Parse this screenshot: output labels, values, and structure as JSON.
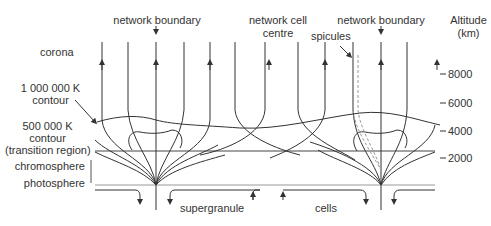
{
  "title_cut": "",
  "labels": {
    "network_boundary_left": "network boundary",
    "network_cell_centre_1": "network cell",
    "network_cell_centre_2": "centre",
    "network_boundary_right": "network boundary",
    "spicules": "spicules",
    "altitude_1": "Altitude",
    "altitude_2": "(km)",
    "corona": "corona",
    "contour_1m_1": "1 000 000 K",
    "contour_1m_2": "contour",
    "contour_500k_1": "500 000 K",
    "contour_500k_2": "contour",
    "contour_500k_3": "(transition region)",
    "chromosphere": "chromosphere",
    "photosphere": "photosphere",
    "supergranule": "supergranule",
    "cells": "cells"
  },
  "altitude_ticks": [
    {
      "label": "8000",
      "y": 74
    },
    {
      "label": "6000",
      "y": 103
    },
    {
      "label": "4000",
      "y": 131
    },
    {
      "label": "2000",
      "y": 158
    }
  ],
  "colors": {
    "line": "#333333",
    "light_line": "#999999",
    "text": "#333333"
  }
}
